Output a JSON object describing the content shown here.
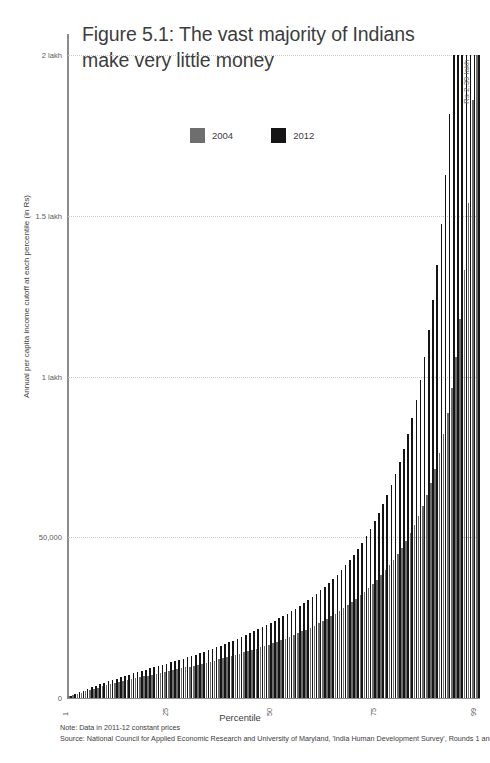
{
  "title": "Figure 5.1: The vast majority of Indians make very little money",
  "legend": {
    "position": "top-center",
    "entries": [
      {
        "label": "2004",
        "color": "#6e6e6e",
        "swatch": "legend-swatch-2004"
      },
      {
        "label": "2012",
        "color": "#151515",
        "swatch": "legend-swatch-2012"
      }
    ]
  },
  "annotation": {
    "text": "Rs 2.39 lakh"
  },
  "footnotes": [
    "Note: Data in 2011-12 constant prices",
    "Source: National Council for Applied Economic Research and University of Maryland, 'India Human Development Survey', Rounds 1 and 2"
  ],
  "chart_data": {
    "type": "bar",
    "title": "Figure 5.1: The vast majority of Indians make very little money",
    "xlabel": "Percentile",
    "ylabel": "Annual per capita income cutoff at each percentile (in Rs)",
    "ylim": [
      0,
      200000
    ],
    "yticks": [
      0,
      50000,
      100000,
      150000,
      200000
    ],
    "ytick_labels": [
      "0",
      "50,000",
      "1 lakh",
      "1.5 lakh",
      "2 lakh"
    ],
    "xlim": [
      1,
      99
    ],
    "xticks": [
      1,
      25,
      50,
      75,
      99
    ],
    "xtick_labels": [
      "1",
      "25",
      "50",
      "75",
      "99"
    ],
    "grid": "horizontal-dotted",
    "legend_position": "top-center",
    "categories": [
      1,
      2,
      3,
      4,
      5,
      6,
      7,
      8,
      9,
      10,
      11,
      12,
      13,
      14,
      15,
      16,
      17,
      18,
      19,
      20,
      21,
      22,
      23,
      24,
      25,
      26,
      27,
      28,
      29,
      30,
      31,
      32,
      33,
      34,
      35,
      36,
      37,
      38,
      39,
      40,
      41,
      42,
      43,
      44,
      45,
      46,
      47,
      48,
      49,
      50,
      51,
      52,
      53,
      54,
      55,
      56,
      57,
      58,
      59,
      60,
      61,
      62,
      63,
      64,
      65,
      66,
      67,
      68,
      69,
      70,
      71,
      72,
      73,
      74,
      75,
      76,
      77,
      78,
      79,
      80,
      81,
      82,
      83,
      84,
      85,
      86,
      87,
      88,
      89,
      90,
      91,
      92,
      93,
      94,
      95,
      96,
      97,
      98,
      99
    ],
    "series": [
      {
        "name": "2004",
        "color": "#6e6e6e",
        "values": [
          500,
          900,
          1300,
          1700,
          2100,
          2500,
          2900,
          3250,
          3600,
          3950,
          4300,
          4600,
          4900,
          5200,
          5500,
          5800,
          6100,
          6400,
          6700,
          7000,
          7300,
          7550,
          7800,
          8050,
          8300,
          8600,
          8900,
          9200,
          9500,
          9800,
          10100,
          10400,
          10700,
          11000,
          11300,
          11650,
          12000,
          12350,
          12700,
          13050,
          13400,
          13800,
          14200,
          14600,
          15000,
          15400,
          15800,
          16200,
          16600,
          17000,
          17500,
          18000,
          18500,
          19000,
          19500,
          20100,
          20700,
          21300,
          21900,
          22500,
          23200,
          23900,
          24600,
          25400,
          26200,
          27000,
          27900,
          28800,
          29800,
          30800,
          31900,
          33000,
          34200,
          35500,
          36800,
          38200,
          39700,
          41300,
          43000,
          44800,
          46800,
          48900,
          51200,
          53700,
          56500,
          59600,
          63000,
          66900,
          71300,
          76300,
          82000,
          88700,
          96500,
          106000,
          118000,
          133000,
          154000,
          186000,
          248000
        ]
      },
      {
        "name": "2012",
        "color": "#151515",
        "values": [
          700,
          1200,
          1750,
          2300,
          2850,
          3350,
          3850,
          4300,
          4750,
          5200,
          5650,
          6050,
          6450,
          6850,
          7250,
          7650,
          8050,
          8450,
          8850,
          9250,
          9650,
          10000,
          10350,
          10700,
          11050,
          11450,
          11850,
          12250,
          12650,
          13050,
          13500,
          13950,
          14400,
          14850,
          15300,
          15800,
          16300,
          16800,
          17300,
          17800,
          18350,
          18950,
          19550,
          20150,
          20750,
          21400,
          22050,
          22700,
          23350,
          24000,
          24750,
          25500,
          26250,
          27000,
          27800,
          28700,
          29600,
          30500,
          31400,
          32400,
          33500,
          34600,
          35800,
          37100,
          38400,
          39800,
          41300,
          42900,
          44600,
          46400,
          48300,
          50400,
          52600,
          55000,
          57500,
          60200,
          63100,
          66300,
          69700,
          73500,
          77600,
          82100,
          87100,
          92700,
          99000,
          106200,
          114400,
          123800,
          134700,
          147500,
          162800,
          181500,
          205000,
          235000,
          276000,
          334000,
          425000,
          590000,
          1020000
        ]
      }
    ]
  }
}
